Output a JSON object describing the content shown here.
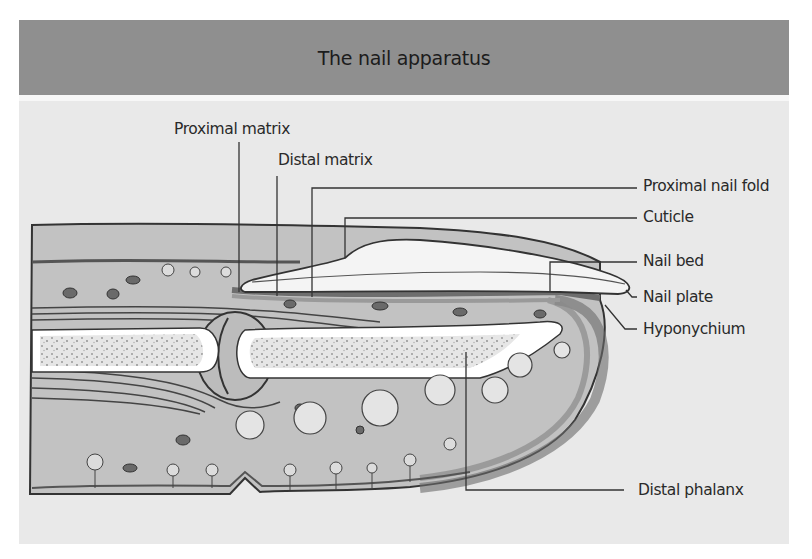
{
  "title": "The nail apparatus",
  "labels": {
    "proximal_matrix": "Proximal matrix",
    "distal_matrix": "Distal matrix",
    "proximal_nail_fold": "Proximal nail fold",
    "cuticle": "Cuticle",
    "nail_bed": "Nail bed",
    "nail_plate": "Nail plate",
    "hyponychium": "Hyponychium",
    "distal_phalanx": "Distal phalanx"
  },
  "colors": {
    "header_bg": "#8f8f8f",
    "panel_bg": "#e9e9e9",
    "tissue": "#bdbdbd",
    "bone": "#ffffff",
    "line": "#333333"
  }
}
